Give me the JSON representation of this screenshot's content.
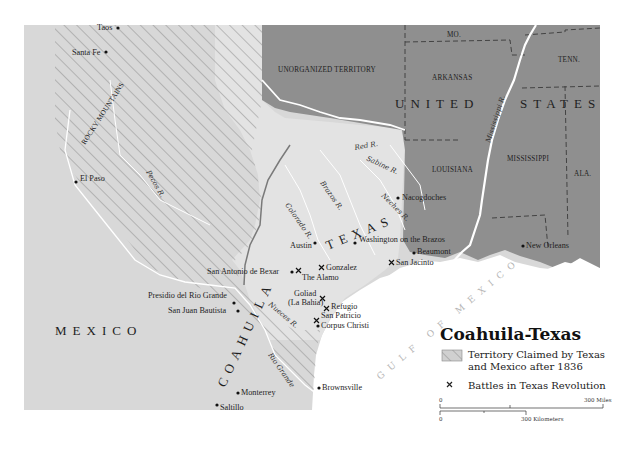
{
  "map": {
    "title": "Coahuila-Texas",
    "regions": {
      "mexico": "MEXICO",
      "united_states": "UNITED STATES",
      "texas": "TEXAS",
      "coahuila": "COAHUILA",
      "unorganized": "UNORGANIZED TERRITORY",
      "rocky_mountains": "ROCKY MOUNTAINS",
      "gulf": "GULF OF MEXICO"
    },
    "states": [
      "MO.",
      "ARKANSAS",
      "TENN.",
      "LOUISIANA",
      "MISSISSIPPI",
      "ALA."
    ],
    "rivers": [
      "Red R.",
      "Sabine R.",
      "Brazos R.",
      "Neches R.",
      "Colorado R.",
      "Pecos R.",
      "Nueces R.",
      "Rio Grande",
      "Mississippi R.",
      "R."
    ],
    "cities": [
      {
        "name": "Taos",
        "type": "city"
      },
      {
        "name": "Santa Fe",
        "type": "city"
      },
      {
        "name": "El Paso",
        "type": "city"
      },
      {
        "name": "Nacogdoches",
        "type": "city"
      },
      {
        "name": "Austin",
        "type": "city"
      },
      {
        "name": "Washington on the Brazos",
        "type": "city"
      },
      {
        "name": "Beaumont",
        "type": "city"
      },
      {
        "name": "San Jacinto",
        "type": "battle"
      },
      {
        "name": "New Orleans",
        "type": "city"
      },
      {
        "name": "San Antonio de Bexar",
        "type": "city"
      },
      {
        "name": "The Alamo",
        "type": "battle"
      },
      {
        "name": "Gonzalez",
        "type": "battle"
      },
      {
        "name": "Goliad",
        "type": "battle"
      },
      {
        "name": "(La Bahia)",
        "type": "label"
      },
      {
        "name": "Refugio",
        "type": "battle"
      },
      {
        "name": "San Patricio",
        "type": "battle"
      },
      {
        "name": "Corpus Christi",
        "type": "city"
      },
      {
        "name": "Presidio del Rio Grande",
        "type": "city"
      },
      {
        "name": "San Juan Bautista",
        "type": "city"
      },
      {
        "name": "Monterrey",
        "type": "city"
      },
      {
        "name": "Saltillo",
        "type": "city"
      },
      {
        "name": "Brownsville",
        "type": "city"
      }
    ]
  },
  "legend": {
    "title": "Coahuila-Texas",
    "items": [
      {
        "label_line1": "Territory Claimed by Texas",
        "label_line2": "and Mexico after 1836",
        "symbol": "hatched-box"
      },
      {
        "label_line1": "Battles in Texas Revolution",
        "symbol": "x-mark"
      }
    ],
    "scale": {
      "miles_start": "0",
      "miles_end": "300 Miles",
      "km_start": "0",
      "km_end": "300 Kilometers"
    }
  },
  "colors": {
    "mexico_fill": "#d9d9d9",
    "texas_fill": "#e4e4e4",
    "us_fill": "#8f8f8f",
    "water": "#ffffff",
    "hatch": "#8a8a8a",
    "border": "#7a7a7a"
  }
}
